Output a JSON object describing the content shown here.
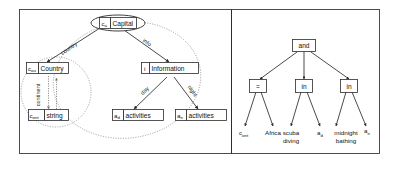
{
  "figure": {
    "panels": [
      {
        "id": "left-panel",
        "name": "conceptual-graph-panel"
      },
      {
        "id": "right-panel",
        "name": "constraint-tree-panel"
      }
    ]
  },
  "left_graph": {
    "nodes": [
      {
        "id": "capital",
        "var": "c",
        "sub": "a",
        "label": "Capital",
        "shape": "ellipse"
      },
      {
        "id": "country",
        "var": "c",
        "sub": "ou",
        "label": "Country",
        "shape": "rect"
      },
      {
        "id": "continent",
        "var": "c",
        "sub": "ont",
        "label": "string",
        "shape": "rect"
      },
      {
        "id": "information",
        "var": "i",
        "sub": "",
        "label": "Information",
        "shape": "rect"
      },
      {
        "id": "day-act",
        "var": "a",
        "sub": "d",
        "label": "activities",
        "shape": "rect"
      },
      {
        "id": "night-act",
        "var": "a",
        "sub": "n",
        "label": "activities",
        "shape": "rect"
      }
    ],
    "edges": [
      {
        "id": "e-country",
        "label": "country",
        "from": "capital",
        "to": "country",
        "style": "solid"
      },
      {
        "id": "e-info",
        "label": "info",
        "from": "capital",
        "to": "information",
        "style": "solid"
      },
      {
        "id": "e-continent",
        "label": "continent",
        "from": "country",
        "to": "continent",
        "style": "dotted"
      },
      {
        "id": "e-day",
        "label": "day",
        "from": "information",
        "to": "day-act",
        "style": "solid"
      },
      {
        "id": "e-night",
        "label": "night",
        "from": "information",
        "to": "night-act",
        "style": "solid"
      }
    ],
    "regions": [
      {
        "id": "region-country",
        "name": "country-scope-circle"
      },
      {
        "id": "region-capital",
        "name": "capital-scope-ellipse"
      }
    ]
  },
  "right_tree": {
    "root": {
      "id": "and",
      "label": "and"
    },
    "operators": [
      {
        "id": "op-eq",
        "label": "="
      },
      {
        "id": "op-in1",
        "label": "in"
      },
      {
        "id": "op-in2",
        "label": "in"
      }
    ],
    "leaves": [
      {
        "id": "leaf-cont",
        "var": "c",
        "sub": "ont",
        "label": ""
      },
      {
        "id": "leaf-africa",
        "var": "",
        "sub": "",
        "label": "Africa"
      },
      {
        "id": "leaf-scuba",
        "var": "",
        "sub": "",
        "label": "scuba",
        "label2": "diving"
      },
      {
        "id": "leaf-ad",
        "var": "a",
        "sub": "d",
        "label": ""
      },
      {
        "id": "leaf-midnight",
        "var": "",
        "sub": "",
        "label": "midnight",
        "label2": "bathing"
      },
      {
        "id": "leaf-an",
        "var": "a",
        "sub": "n",
        "label": ""
      }
    ]
  },
  "colors": {
    "stroke": "#2b2b2b",
    "dotted": "#8a8a8a",
    "frame": "#3a3a3a",
    "background": "#ffffff"
  }
}
